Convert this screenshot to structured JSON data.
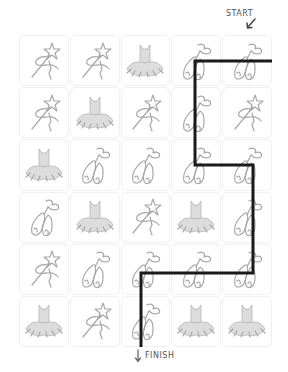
{
  "puzzle": {
    "start_label": "START",
    "finish_label": "FINISH",
    "rows": 6,
    "cols": 5,
    "path_color": "#1a1a1a",
    "grid": [
      [
        "wand",
        "wand",
        "tutu",
        "ballet-shoes",
        "ballet-shoes"
      ],
      [
        "wand",
        "tutu",
        "wand",
        "ballet-shoes",
        "wand"
      ],
      [
        "tutu",
        "ballet-shoes",
        "ballet-shoes",
        "ballet-shoes",
        "ballet-shoes"
      ],
      [
        "ballet-shoes",
        "tutu",
        "wand",
        "tutu",
        "ballet-shoes"
      ],
      [
        "wand",
        "ballet-shoes",
        "ballet-shoes",
        "ballet-shoes",
        "ballet-shoes"
      ],
      [
        "tutu",
        "wand",
        "ballet-shoes",
        "tutu",
        "tutu"
      ]
    ]
  }
}
